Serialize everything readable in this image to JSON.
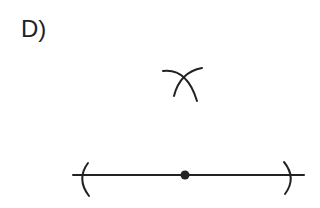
{
  "label": "D)",
  "diagram": {
    "stroke_color": "#222222"
  }
}
